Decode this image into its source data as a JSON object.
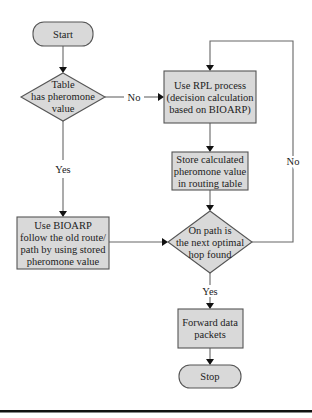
{
  "diagram": {
    "type": "flowchart",
    "colors": {
      "node_fill": "#d9d9d9",
      "node_stroke": "#555555",
      "line": "#666666",
      "arrow": "#111111"
    },
    "nodes": {
      "start": {
        "kind": "terminator",
        "lines": [
          "Start"
        ]
      },
      "decision_table": {
        "kind": "decision",
        "lines": [
          "Table",
          "has pheromone",
          "value"
        ]
      },
      "rpl_process": {
        "kind": "process",
        "lines": [
          "Use RPL process",
          "(decision calculation",
          "based on BIOARP)"
        ]
      },
      "store_pheromone": {
        "kind": "process",
        "lines": [
          "Store calculated",
          "pheromone value",
          "in routing table"
        ]
      },
      "use_bioarp": {
        "kind": "process",
        "lines": [
          "Use BIOARP",
          "follow the old route/",
          "path by using stored",
          "pheromone value"
        ]
      },
      "decision_hop": {
        "kind": "decision",
        "lines": [
          "On path is",
          "the next optimal",
          "hop found"
        ]
      },
      "forward": {
        "kind": "process",
        "lines": [
          "Forward data",
          "packets"
        ]
      },
      "stop": {
        "kind": "terminator",
        "lines": [
          "Stop"
        ]
      }
    },
    "edges": [
      {
        "from": "start",
        "to": "decision_table",
        "label": ""
      },
      {
        "from": "decision_table",
        "to": "rpl_process",
        "label": "No"
      },
      {
        "from": "decision_table",
        "to": "use_bioarp",
        "label": "Yes"
      },
      {
        "from": "rpl_process",
        "to": "store_pheromone",
        "label": ""
      },
      {
        "from": "store_pheromone",
        "to": "decision_hop",
        "label": ""
      },
      {
        "from": "use_bioarp",
        "to": "decision_hop",
        "label": ""
      },
      {
        "from": "decision_hop",
        "to": "rpl_process",
        "label": "No"
      },
      {
        "from": "decision_hop",
        "to": "forward",
        "label": "Yes"
      },
      {
        "from": "forward",
        "to": "stop",
        "label": ""
      }
    ],
    "edge_labels": {
      "no_1": "No",
      "yes_1": "Yes",
      "no_2": "No",
      "yes_2": "Yes"
    }
  }
}
